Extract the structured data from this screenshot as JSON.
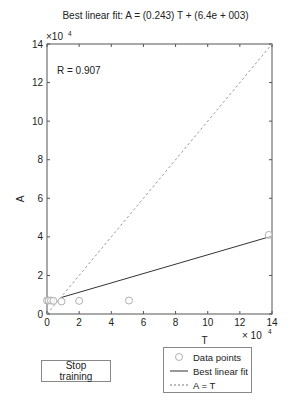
{
  "chart_data": {
    "type": "scatter",
    "title": "Best linear fit: A = (0.243) T + (6.4e + 003)",
    "xlabel": "T",
    "ylabel": "A",
    "x_exponent_label": "× 10^4",
    "y_exponent_label": "×10^4",
    "xlim": [
      0,
      140000
    ],
    "ylim": [
      0,
      140000
    ],
    "xticks": [
      0,
      2,
      4,
      6,
      8,
      10,
      12,
      14
    ],
    "yticks": [
      0,
      2,
      4,
      6,
      8,
      10,
      12,
      14
    ],
    "annotation": "R = 0.907",
    "series": [
      {
        "name": "Data points",
        "style": "circle-markers",
        "color": "#b0b0b0",
        "points": [
          [
            0,
            7000
          ],
          [
            1000,
            7000
          ],
          [
            2500,
            7000
          ],
          [
            4000,
            6800
          ],
          [
            9000,
            6500
          ],
          [
            20000,
            6800
          ],
          [
            51000,
            7000
          ],
          [
            138000,
            41000
          ]
        ]
      },
      {
        "name": "Best linear fit",
        "style": "solid",
        "color": "#333333",
        "slope": 0.243,
        "intercept": 6400,
        "x_range": [
          9000,
          140000
        ]
      },
      {
        "name": "A = T",
        "style": "dashed",
        "color": "#999999",
        "slope": 1,
        "intercept": 0,
        "x_range": [
          0,
          140000
        ]
      }
    ],
    "grid": false,
    "legend_position": "below-right"
  },
  "title": "Best linear fit: A = (0.243) T + (6.4e + 003)",
  "axes": {
    "xlabel": "T",
    "ylabel": "A",
    "x_ticks": [
      "0",
      "2",
      "4",
      "6",
      "8",
      "10",
      "12",
      "14"
    ],
    "y_ticks": [
      "0",
      "2",
      "4",
      "6",
      "8",
      "10",
      "12",
      "14"
    ],
    "x_exp": "× 10",
    "y_exp": "×10",
    "exp_power": "4"
  },
  "annotation": "R = 0.907",
  "controls": {
    "stop_training": "Stop training"
  },
  "legend": {
    "items": [
      {
        "label": "Data points"
      },
      {
        "label": "Best linear fit"
      },
      {
        "label": "A = T"
      }
    ]
  }
}
